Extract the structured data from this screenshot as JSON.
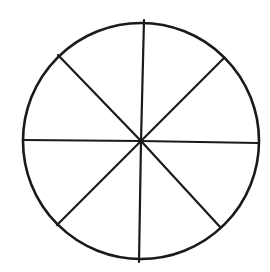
{
  "diagram": {
    "title": "",
    "sector_count": 8,
    "colors": {
      "stroke": "#1a1a1a",
      "background": "#ffffff"
    },
    "circle": {
      "cx": 141,
      "cy": 141,
      "r": 118,
      "stroke_width": 2.6
    },
    "center_dot": {
      "cx": 141,
      "cy": 141,
      "r": 2.6
    },
    "spokes": [
      {
        "name": "spoke-top",
        "x1": 141,
        "y1": 141,
        "x2": 144,
        "y2": 20
      },
      {
        "name": "spoke-upper-right",
        "x1": 141,
        "y1": 141,
        "x2": 224,
        "y2": 58
      },
      {
        "name": "spoke-right",
        "x1": 141,
        "y1": 141,
        "x2": 258,
        "y2": 143
      },
      {
        "name": "spoke-lower-right",
        "x1": 141,
        "y1": 141,
        "x2": 221,
        "y2": 228
      },
      {
        "name": "spoke-bottom",
        "x1": 141,
        "y1": 141,
        "x2": 139,
        "y2": 262
      },
      {
        "name": "spoke-lower-left",
        "x1": 141,
        "y1": 141,
        "x2": 57,
        "y2": 225
      },
      {
        "name": "spoke-left",
        "x1": 141,
        "y1": 141,
        "x2": 23,
        "y2": 140
      },
      {
        "name": "spoke-upper-left",
        "x1": 141,
        "y1": 141,
        "x2": 58,
        "y2": 55
      }
    ],
    "spoke_width": 2.2
  }
}
